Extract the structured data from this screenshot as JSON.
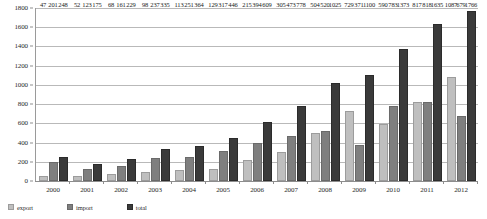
{
  "chart_data": {
    "type": "bar",
    "title": "",
    "subtitle": "",
    "xlabel": "",
    "ylabel": "",
    "categories": [
      "2000",
      "2001",
      "2002",
      "2003",
      "2004",
      "2005",
      "2006",
      "2007",
      "2008",
      "2009",
      "2010",
      "2011",
      "2012"
    ],
    "ylim": [
      0,
      1800
    ],
    "yticks": [
      0,
      200,
      400,
      600,
      800,
      1000,
      1200,
      1400,
      1600,
      1800
    ],
    "ytick_labels": [
      "0",
      "200",
      "400",
      "600",
      "800",
      "1000",
      "1200",
      "1400",
      "1600",
      "1800"
    ],
    "grid": true,
    "legend_position": "bottom-left",
    "series": [
      {
        "name": "export",
        "color": "#bfbfbf",
        "values": [
          47,
          52,
          68,
          98,
          113,
          129,
          215,
          305,
          504,
          729,
          590,
          817,
          1087
        ],
        "labels": [
          "47",
          "52",
          "68",
          "98",
          "113",
          "129",
          "215",
          "305",
          "504",
          "729",
          "590",
          "817",
          "1087"
        ]
      },
      {
        "name": "import",
        "color": "#7f7f7f",
        "values": [
          201,
          123,
          161,
          237,
          251,
          317,
          394,
          473,
          520,
          371,
          783,
          818,
          679
        ],
        "labels": [
          "201",
          "123",
          "161",
          "237",
          "251",
          "317",
          "394",
          "473",
          "520",
          "371",
          "783",
          "818",
          "679"
        ]
      },
      {
        "name": "total",
        "color": "#3a3a3a",
        "values": [
          248,
          175,
          229,
          335,
          364,
          446,
          609,
          778,
          1025,
          1100,
          1373,
          1635,
          1766
        ],
        "labels": [
          "248",
          "175",
          "229",
          "335",
          "364",
          "446",
          "609",
          "778",
          "1025",
          "1100",
          "1373",
          "1635",
          "1766"
        ]
      }
    ]
  },
  "legend": {
    "items": [
      {
        "label": "export"
      },
      {
        "label": "import"
      },
      {
        "label": "total"
      }
    ]
  }
}
